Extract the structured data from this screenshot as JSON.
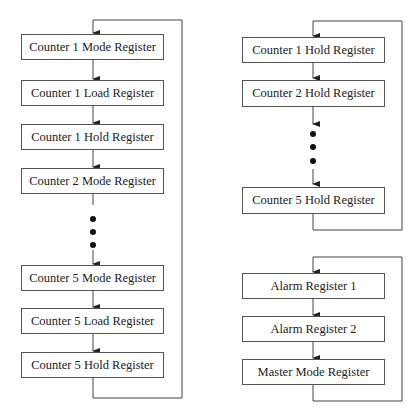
{
  "left_chain": {
    "boxes": [
      {
        "label": "Counter 1 Mode Register"
      },
      {
        "label": "Counter 1 Load Register"
      },
      {
        "label": "Counter 1 Hold Register"
      },
      {
        "label": "Counter 2 Mode Register"
      },
      {
        "label": "Counter 5 Mode Register"
      },
      {
        "label": "Counter 5 Load Register"
      },
      {
        "label": "Counter 5 Hold Register"
      }
    ],
    "ellipsis": "dots"
  },
  "right_top_chain": {
    "boxes": [
      {
        "label": "Counter 1 Hold Register"
      },
      {
        "label": "Counter 2 Hold Register"
      },
      {
        "label": "Counter 5 Hold Register"
      }
    ],
    "ellipsis": "dots"
  },
  "right_bottom_chain": {
    "boxes": [
      {
        "label": "Alarm Register 1"
      },
      {
        "label": "Alarm Register 2"
      },
      {
        "label": "Master Mode Register"
      }
    ]
  },
  "colors": {
    "line": "#444444",
    "box_border": "#555555",
    "text": "#222222"
  }
}
